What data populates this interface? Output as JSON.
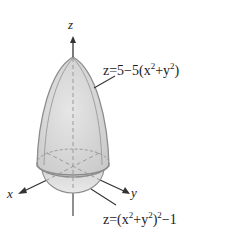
{
  "figure": {
    "axes": {
      "z_label": "z",
      "x_label": "x",
      "y_label": "y"
    },
    "surfaces": [
      {
        "name": "upper-paraboloid",
        "equation_lhs": "z",
        "equation_parts": [
          "=5−5(x",
          "2",
          "+y",
          "2",
          ")"
        ]
      },
      {
        "name": "lower-quartic",
        "equation_lhs": "z",
        "equation_parts": [
          "=(x",
          "2",
          "+y",
          "2",
          ")",
          "2",
          "−1"
        ]
      }
    ],
    "colors": {
      "surface_fill": "#d9d9d9",
      "surface_edge": "#8c8c8c",
      "axis": "#333333",
      "dashed": "#9a9a9a",
      "text": "#1a1a1a"
    }
  }
}
